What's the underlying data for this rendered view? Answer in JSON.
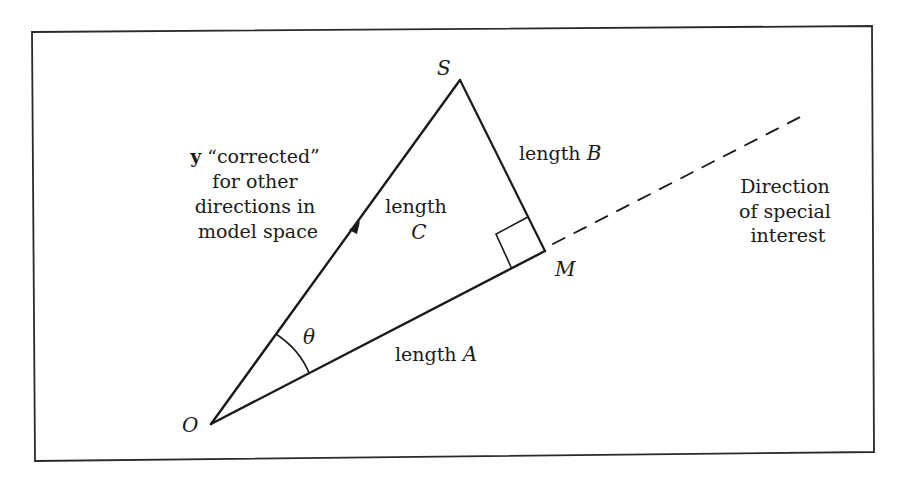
{
  "diagram": {
    "type": "geometric-vector-diagram",
    "frame": {
      "top_left": [
        32,
        32
      ],
      "top_right": [
        872,
        26
      ],
      "bottom_right": [
        874,
        452
      ],
      "bottom_left": [
        35,
        461
      ]
    },
    "points": {
      "O": {
        "label": "O",
        "x": 211,
        "y": 424
      },
      "S": {
        "label": "S",
        "x": 460,
        "y": 80
      },
      "M": {
        "label": "M",
        "x": 545,
        "y": 251
      }
    },
    "segments": [
      {
        "from": "O",
        "to": "S",
        "style": "solid",
        "arrow_at": [
          355,
          228
        ],
        "label_ref": "labels.length_c"
      },
      {
        "from": "S",
        "to": "M",
        "style": "solid",
        "label_ref": "labels.length_b"
      },
      {
        "from": "O",
        "to": "M",
        "style": "solid",
        "label_ref": "labels.length_a"
      },
      {
        "from": [
          553,
          244
        ],
        "to": [
          808,
          113
        ],
        "style": "dashed",
        "label_ref": "labels.direction"
      }
    ],
    "right_angle_at": "M",
    "angle": {
      "vertex": "O",
      "symbol": "θ"
    }
  },
  "labels": {
    "vertex_o": "O",
    "vertex_s": "S",
    "vertex_m": "M",
    "theta": "θ",
    "y_vector": {
      "bold_symbol": "y",
      "line1_rest": " “corrected”",
      "line2": "for other",
      "line3": "directions in",
      "line4": "model space"
    },
    "length_a": {
      "word": "length",
      "var": "A"
    },
    "length_b": {
      "word": "length",
      "var": "B"
    },
    "length_c": {
      "word": "length",
      "var": "C"
    },
    "direction": {
      "line1": "Direction",
      "line2": "of special",
      "line3": "interest"
    }
  },
  "colors": {
    "ink": "#1a1a1a",
    "background": "#ffffff"
  }
}
